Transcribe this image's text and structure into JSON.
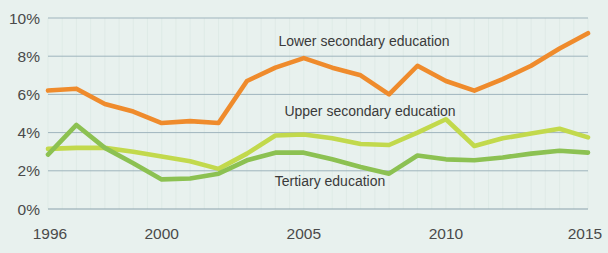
{
  "chart_data": {
    "type": "line",
    "title": "",
    "subtitle": "",
    "xlabel": "",
    "ylabel": "",
    "xlim": [
      1996,
      2015
    ],
    "ylim": [
      0,
      10
    ],
    "ytick_values": [
      0,
      2,
      4,
      6,
      8,
      10
    ],
    "ytick_labels": [
      "0%",
      "2%",
      "4%",
      "6%",
      "8%",
      "10%"
    ],
    "xtick_values": [
      1996,
      2000,
      2005,
      2010,
      2015
    ],
    "xtick_labels": [
      "1996",
      "2000",
      "2005",
      "2010",
      "2015"
    ],
    "grid": "horizontal",
    "legend_position": "inline-annotations",
    "x": [
      1996,
      1997,
      1998,
      1999,
      2000,
      2001,
      2002,
      2003,
      2004,
      2005,
      2006,
      2007,
      2008,
      2009,
      2010,
      2011,
      2012,
      2013,
      2014,
      2015
    ],
    "series": [
      {
        "name": "Lower secondary education",
        "color": "#ef8b2c",
        "values": [
          6.2,
          6.3,
          5.5,
          5.1,
          4.5,
          4.6,
          4.5,
          6.7,
          7.4,
          7.9,
          7.4,
          7.0,
          6.0,
          7.5,
          6.7,
          6.2,
          6.8,
          7.5,
          8.4,
          9.2
        ]
      },
      {
        "name": "Upper secondary education",
        "color": "#c2d94c",
        "values": [
          3.15,
          3.2,
          3.2,
          3.0,
          2.75,
          2.5,
          2.1,
          2.9,
          3.85,
          3.9,
          3.7,
          3.4,
          3.35,
          4.0,
          4.7,
          3.3,
          3.7,
          3.95,
          4.2,
          3.75
        ]
      },
      {
        "name": "Tertiary education",
        "color": "#8cc152",
        "values": [
          2.85,
          4.4,
          3.2,
          2.4,
          1.55,
          1.6,
          1.85,
          2.55,
          2.95,
          2.95,
          2.6,
          2.2,
          1.85,
          2.8,
          2.6,
          2.55,
          2.7,
          2.9,
          3.05,
          2.95
        ]
      }
    ],
    "annotations": [
      {
        "text": "Lower secondary education",
        "x_px": 364,
        "y_px": 46,
        "series": "Lower secondary education"
      },
      {
        "text": "Upper secondary education",
        "x_px": 370,
        "y_px": 116,
        "series": "Upper secondary education"
      },
      {
        "text": "Tertiary education",
        "x_px": 330,
        "y_px": 186,
        "series": "Tertiary education"
      }
    ]
  },
  "style": {
    "background": "#e8f1ee",
    "gridline_color": "#9fb4bd",
    "text_color": "#4a4a4a"
  }
}
